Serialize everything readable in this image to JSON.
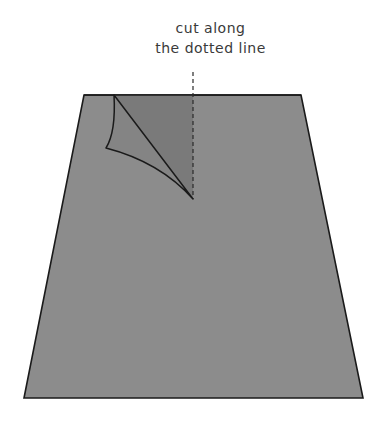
{
  "instruction": {
    "line1": "cut along",
    "line2": "the dotted line"
  },
  "colors": {
    "paper": "#8c8c8c",
    "flap_shadow": "#7a7a7a",
    "outline": "#1a1a1a",
    "text": "#3a3a3a"
  }
}
